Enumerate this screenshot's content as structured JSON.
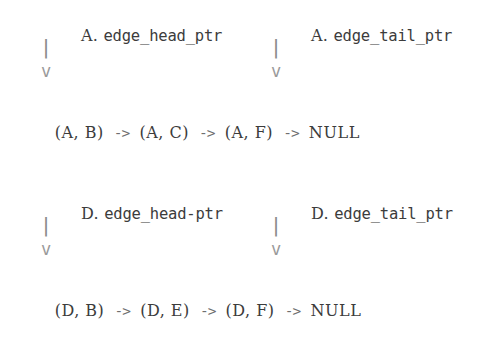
{
  "document": {
    "background_color": "#ffffff",
    "text_color": "#3c3c3c",
    "arrow_color": "#8d8d8d"
  },
  "blocks": [
    {
      "vertex": "A",
      "headers": {
        "left": {
          "prefix": "A.",
          "identifier": "edge_head_ptr"
        },
        "right": {
          "prefix": "A.",
          "identifier": "edge_tail_ptr"
        }
      },
      "arrows": {
        "left": {
          "bar": "|",
          "head": "v"
        },
        "right": {
          "bar": "|",
          "head": "v"
        }
      },
      "list": {
        "nodes": [
          "(A, B)",
          "(A, C)",
          "(A, F)"
        ],
        "separator": "->",
        "terminator": "NULL"
      }
    },
    {
      "vertex": "D",
      "headers": {
        "left": {
          "prefix": "D.",
          "identifier": "edge_head-ptr"
        },
        "right": {
          "prefix": "D.",
          "identifier": "edge_tail_ptr"
        }
      },
      "arrows": {
        "left": {
          "bar": "|",
          "head": "v"
        },
        "right": {
          "bar": "|",
          "head": "v"
        }
      },
      "list": {
        "nodes": [
          "(D, B)",
          "(D, E)",
          "(D, F)"
        ],
        "separator": "->",
        "terminator": "NULL"
      }
    }
  ]
}
